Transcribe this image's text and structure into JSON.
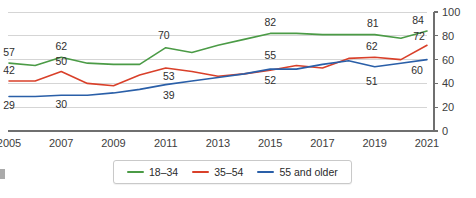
{
  "title": {
    "text": "",
    "visible_note": "clipped"
  },
  "chart_data": {
    "type": "line",
    "title": "",
    "subtitle": "",
    "xlabel": "",
    "ylabel": "",
    "ylim": [
      0,
      100
    ],
    "yticks": [
      0,
      20,
      40,
      60,
      80,
      100
    ],
    "grid": true,
    "legend_position": "bottom",
    "x": [
      2005,
      2006,
      2007,
      2008,
      2009,
      2010,
      2011,
      2012,
      2013,
      2014,
      2015,
      2016,
      2017,
      2018,
      2019,
      2020,
      2021
    ],
    "xtick_labels": [
      "2005",
      "2007",
      "2009",
      "2011",
      "2013",
      "2015",
      "2017",
      "2019",
      "2021"
    ],
    "xticks": [
      2005,
      2007,
      2009,
      2011,
      2013,
      2015,
      2017,
      2019,
      2021
    ],
    "series": [
      {
        "name": "18–34",
        "color": "#4b9b46",
        "values": [
          57,
          55,
          62,
          57,
          56,
          56,
          70,
          66,
          72,
          77,
          82,
          82,
          81,
          81,
          81,
          78,
          84
        ]
      },
      {
        "name": "35–54",
        "color": "#d9402a",
        "values": [
          42,
          42,
          50,
          40,
          38,
          47,
          53,
          50,
          46,
          48,
          51,
          55,
          53,
          61,
          62,
          60,
          72
        ]
      },
      {
        "name": "55 and older",
        "color": "#2a5fa8",
        "values": [
          29,
          29,
          30,
          30,
          32,
          35,
          39,
          42,
          45,
          48,
          52,
          52,
          56,
          59,
          54,
          57,
          60
        ]
      }
    ],
    "annotations": [
      {
        "x": 2005,
        "value": 57,
        "series": "18–34",
        "label": "57"
      },
      {
        "x": 2007,
        "value": 62,
        "series": "18–34",
        "label": "62"
      },
      {
        "x": 2011,
        "value": 70,
        "series": "18–34",
        "label": "70"
      },
      {
        "x": 2015,
        "value": 82,
        "series": "18–34",
        "label": "82"
      },
      {
        "x": 2019,
        "value": 81,
        "series": "18–34",
        "label": "81"
      },
      {
        "x": 2021,
        "value": 84,
        "series": "18–34",
        "label": "84"
      },
      {
        "x": 2005,
        "value": 42,
        "series": "35–54",
        "label": "42"
      },
      {
        "x": 2007,
        "value": 50,
        "series": "35–54",
        "label": "50"
      },
      {
        "x": 2011,
        "value": 53,
        "series": "35–54",
        "label": "53"
      },
      {
        "x": 2015,
        "value": 55,
        "series": "35–54",
        "label": "55"
      },
      {
        "x": 2019,
        "value": 62,
        "series": "35–54",
        "label": "62"
      },
      {
        "x": 2021,
        "value": 72,
        "series": "35–54",
        "label": "72"
      },
      {
        "x": 2005,
        "value": 29,
        "series": "55 and older",
        "label": "29"
      },
      {
        "x": 2007,
        "value": 30,
        "series": "55 and older",
        "label": "30"
      },
      {
        "x": 2011,
        "value": 39,
        "series": "55 and older",
        "label": "39"
      },
      {
        "x": 2015,
        "value": 52,
        "series": "55 and older",
        "label": "52"
      },
      {
        "x": 2019,
        "value": 51,
        "series": "55 and older",
        "label": "51"
      },
      {
        "x": 2021,
        "value": 60,
        "series": "55 and older",
        "label": "60"
      }
    ]
  },
  "legend": {
    "items": [
      {
        "label": "18–34",
        "color": "#4b9b46"
      },
      {
        "label": "35–54",
        "color": "#d9402a"
      },
      {
        "label": "55 and older",
        "color": "#2a5fa8"
      }
    ]
  },
  "colors": {
    "green": "#4b9b46",
    "red": "#d9402a",
    "blue": "#2a5fa8",
    "gridline": "#d5d5d5",
    "axis": "#6f6f6f",
    "text": "#2f2f2f"
  }
}
